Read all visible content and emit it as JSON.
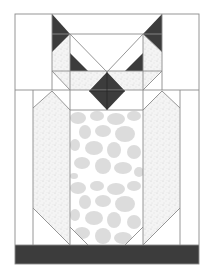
{
  "figure": {
    "title": "Owl quilt block pattern",
    "width": 206,
    "height": 271
  },
  "colors": {
    "background": "#ffffff",
    "outline": "#8a8a8a",
    "dark": "#3c3c3c",
    "speckle_base": "#f4f4f4",
    "speckle_dot": "#c8c8c8",
    "belly_base": "#ffffff",
    "belly_stone": "#dcdcdc",
    "white": "#ffffff"
  },
  "parts": {
    "ears": "Two dark triangular ears at top corners of head",
    "eyes": "Two dark triangle eyes beside center V",
    "beak": "Dark diamond beak",
    "wings": "Speckled pointed wing panels",
    "belly": "Light gray stone-patterned belly panel",
    "base": "Dark horizontal band at bottom"
  }
}
